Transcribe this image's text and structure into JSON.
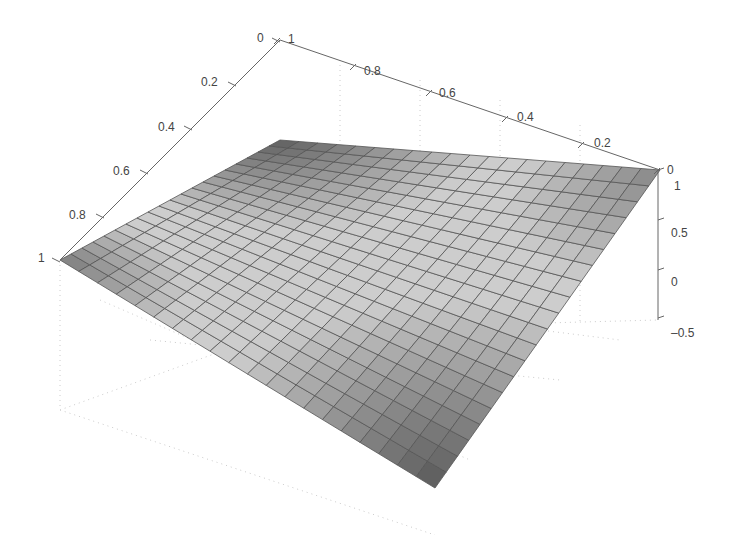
{
  "chart_data": {
    "type": "surface3d",
    "title": "",
    "xlabel": "",
    "ylabel": "",
    "zlabel": "",
    "grid": true,
    "colormap": "gray",
    "mesh_resolution": [
      20,
      20
    ],
    "x_axis": {
      "range": [
        0,
        1
      ],
      "ticks": [
        "0",
        "0.2",
        "0.4",
        "0.6",
        "0.8",
        "1"
      ],
      "orientation": "left-front edge, 0 at back-top to 1 at front-left"
    },
    "y_axis": {
      "range": [
        0,
        1
      ],
      "ticks": [
        "1",
        "0.8",
        "0.6",
        "0.4",
        "0.2",
        "0"
      ],
      "orientation": "back edge, 1 at left to 0 at right"
    },
    "z_axis": {
      "range": [
        -0.5,
        1
      ],
      "ticks": [
        "1",
        "0.5",
        "0",
        "-0.5"
      ]
    },
    "surface_description": "Saddle-like bilinear surface: dark (low) at top-back corner and bottom-front corner; dark at left and right corners with lighter center band",
    "corners": [
      {
        "x": 1,
        "y": 1,
        "z": 1,
        "shade": "dark"
      },
      {
        "x": 0,
        "y": 1,
        "z": 1,
        "shade": "dark"
      },
      {
        "x": 0,
        "y": 0,
        "z": 1,
        "shade": "dark"
      },
      {
        "x": 1,
        "y": 0,
        "z": -0.5,
        "shade": "dark"
      }
    ]
  },
  "labels": {
    "x_ticks": [
      {
        "text": "0",
        "x": 257,
        "y": 42
      },
      {
        "text": "0.2",
        "x": 201,
        "y": 86
      },
      {
        "text": "0.4",
        "x": 158,
        "y": 131
      },
      {
        "text": "0.6",
        "x": 113,
        "y": 175
      },
      {
        "text": "0.8",
        "x": 69,
        "y": 219
      },
      {
        "text": "1",
        "x": 38,
        "y": 262
      }
    ],
    "y_ticks": [
      {
        "text": "1",
        "x": 288,
        "y": 43
      },
      {
        "text": "0.8",
        "x": 364,
        "y": 75
      },
      {
        "text": "0.6",
        "x": 439,
        "y": 97
      },
      {
        "text": "0.4",
        "x": 517,
        "y": 121
      },
      {
        "text": "0.2",
        "x": 594,
        "y": 147
      },
      {
        "text": "0",
        "x": 667,
        "y": 174
      }
    ],
    "z_ticks": [
      {
        "text": "1",
        "x": 674,
        "y": 190
      },
      {
        "text": "0.5",
        "x": 671,
        "y": 237
      },
      {
        "text": "0",
        "x": 671,
        "y": 286
      },
      {
        "text": "-0.5",
        "x": 671,
        "y": 337
      }
    ]
  }
}
